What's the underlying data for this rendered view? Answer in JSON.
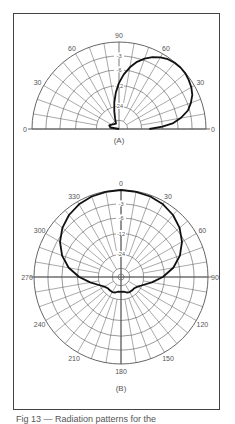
{
  "figure": {
    "caption": "Fig 13 — Radiation patterns for the",
    "colors": {
      "grid": "#555555",
      "pattern": "#111111",
      "frame": "#444444",
      "text": "#555555"
    }
  },
  "chart_data": [
    {
      "type": "polar-line",
      "label": "(A)",
      "description": "Elevation radiation pattern (half-plane, 0 to 180 degrees)",
      "angle_range": [
        0,
        180
      ],
      "angle_labels": [
        {
          "angle": 0,
          "text": "0"
        },
        {
          "angle": 30,
          "text": "30"
        },
        {
          "angle": 60,
          "text": "60"
        },
        {
          "angle": 90,
          "text": "90"
        },
        {
          "angle": 120,
          "text": "60"
        },
        {
          "angle": 150,
          "text": "30"
        },
        {
          "angle": 180,
          "text": "0"
        }
      ],
      "ring_labels_db": [
        "-3",
        "-6",
        "-12",
        "-24"
      ],
      "rings_normalized": [
        1.0,
        0.84,
        0.68,
        0.5,
        0.26,
        0.1
      ],
      "grid_spoke_step_deg": 10,
      "series": [
        {
          "name": "pattern",
          "points_deg_r": [
            [
              0,
              0.35
            ],
            [
              3,
              0.5
            ],
            [
              6,
              0.62
            ],
            [
              10,
              0.72
            ],
            [
              15,
              0.82
            ],
            [
              20,
              0.88
            ],
            [
              25,
              0.93
            ],
            [
              30,
              0.96
            ],
            [
              35,
              0.98
            ],
            [
              40,
              0.995
            ],
            [
              45,
              1.0
            ],
            [
              50,
              0.995
            ],
            [
              55,
              0.98
            ],
            [
              60,
              0.95
            ],
            [
              65,
              0.91
            ],
            [
              70,
              0.86
            ],
            [
              75,
              0.8
            ],
            [
              80,
              0.72
            ],
            [
              85,
              0.63
            ],
            [
              90,
              0.53
            ],
            [
              95,
              0.42
            ],
            [
              100,
              0.31
            ],
            [
              105,
              0.21
            ],
            [
              110,
              0.13
            ],
            [
              120,
              0.07
            ],
            [
              135,
              0.08
            ],
            [
              150,
              0.1
            ],
            [
              160,
              0.12
            ],
            [
              170,
              0.1
            ],
            [
              180,
              0.0
            ]
          ]
        }
      ]
    },
    {
      "type": "polar-line",
      "label": "(B)",
      "description": "Azimuth radiation pattern (full circle, 0 to 330 degrees)",
      "angle_range": [
        0,
        360
      ],
      "angle_labels": [
        {
          "angle": 0,
          "text": "0"
        },
        {
          "angle": 30,
          "text": "30"
        },
        {
          "angle": 60,
          "text": "60"
        },
        {
          "angle": 90,
          "text": "90"
        },
        {
          "angle": 120,
          "text": "120"
        },
        {
          "angle": 150,
          "text": "150"
        },
        {
          "angle": 180,
          "text": "180"
        },
        {
          "angle": 210,
          "text": "210"
        },
        {
          "angle": 240,
          "text": "240"
        },
        {
          "angle": 270,
          "text": "270"
        },
        {
          "angle": 300,
          "text": "300"
        },
        {
          "angle": 330,
          "text": "330"
        }
      ],
      "ring_labels_db": [
        "-3",
        "-6",
        "-12",
        "-24"
      ],
      "rings_normalized": [
        1.0,
        0.84,
        0.68,
        0.5,
        0.26,
        0.1
      ],
      "grid_spoke_step_deg": 10,
      "series": [
        {
          "name": "pattern",
          "points_deg_r": [
            [
              0,
              1.0
            ],
            [
              10,
              0.995
            ],
            [
              20,
              0.985
            ],
            [
              30,
              0.965
            ],
            [
              40,
              0.93
            ],
            [
              50,
              0.88
            ],
            [
              60,
              0.81
            ],
            [
              70,
              0.72
            ],
            [
              80,
              0.61
            ],
            [
              90,
              0.48
            ],
            [
              100,
              0.36
            ],
            [
              110,
              0.27
            ],
            [
              120,
              0.22
            ],
            [
              130,
              0.2
            ],
            [
              140,
              0.2
            ],
            [
              150,
              0.2
            ],
            [
              160,
              0.19
            ],
            [
              170,
              0.17
            ],
            [
              180,
              0.17
            ],
            [
              190,
              0.17
            ],
            [
              200,
              0.19
            ],
            [
              210,
              0.2
            ],
            [
              220,
              0.2
            ],
            [
              230,
              0.2
            ],
            [
              240,
              0.22
            ],
            [
              250,
              0.27
            ],
            [
              260,
              0.36
            ],
            [
              270,
              0.48
            ],
            [
              280,
              0.61
            ],
            [
              290,
              0.72
            ],
            [
              300,
              0.81
            ],
            [
              310,
              0.88
            ],
            [
              320,
              0.93
            ],
            [
              330,
              0.965
            ],
            [
              340,
              0.985
            ],
            [
              350,
              0.995
            ]
          ]
        }
      ]
    }
  ]
}
